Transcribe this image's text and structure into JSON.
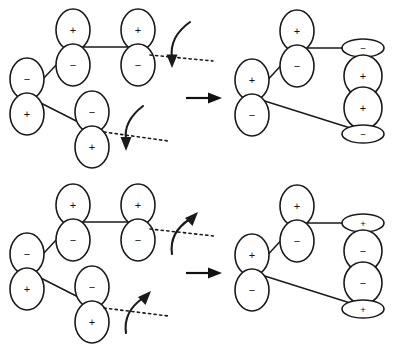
{
  "figure": {
    "stroke_color": "#1a1a1a",
    "background_color": "#ffffff"
  },
  "signs": {
    "plus": "+",
    "minus": "−"
  },
  "rows": [
    {
      "id": "row-top",
      "rotation_sense": "down",
      "reactant": {
        "name": "reactant-orbital-array-top",
        "orbitals": [
          {
            "id": "left-terminal",
            "top_lobe": "−",
            "bottom_lobe": "+"
          },
          {
            "id": "upper-inner",
            "top_lobe": "+",
            "bottom_lobe": "−"
          },
          {
            "id": "upper-terminal",
            "top_lobe": "+",
            "bottom_lobe": "−"
          },
          {
            "id": "lower-inner",
            "top_lobe": "−",
            "bottom_lobe": "+"
          }
        ]
      },
      "rotation_arrows": [
        {
          "id": "arrow-upper-terminal",
          "direction": "down"
        },
        {
          "id": "arrow-lower-terminal",
          "direction": "down"
        }
      ],
      "reaction_arrow": {
        "name": "reaction-arrow-top",
        "direction": "right"
      },
      "product": {
        "name": "product-orbital-array-top",
        "orbitals": [
          {
            "id": "prod-left-terminal",
            "top_lobe": "+",
            "bottom_lobe": "−"
          },
          {
            "id": "prod-upper-inner",
            "top_lobe": "+",
            "bottom_lobe": "−"
          },
          {
            "id": "prod-stack-upper",
            "top_lobe": "−",
            "bottom_lobe": "+",
            "top_flat": true
          },
          {
            "id": "prod-stack-lower",
            "top_lobe": "+",
            "bottom_lobe": "−",
            "bottom_flat": true
          }
        ]
      }
    },
    {
      "id": "row-bottom",
      "rotation_sense": "up",
      "reactant": {
        "name": "reactant-orbital-array-bottom",
        "orbitals": [
          {
            "id": "left-terminal",
            "top_lobe": "−",
            "bottom_lobe": "+"
          },
          {
            "id": "upper-inner",
            "top_lobe": "+",
            "bottom_lobe": "−"
          },
          {
            "id": "upper-terminal",
            "top_lobe": "+",
            "bottom_lobe": "−"
          },
          {
            "id": "lower-inner",
            "top_lobe": "−",
            "bottom_lobe": "+"
          }
        ]
      },
      "rotation_arrows": [
        {
          "id": "arrow-upper-terminal",
          "direction": "up"
        },
        {
          "id": "arrow-lower-terminal",
          "direction": "up"
        }
      ],
      "reaction_arrow": {
        "name": "reaction-arrow-bottom",
        "direction": "right"
      },
      "product": {
        "name": "product-orbital-array-bottom",
        "orbitals": [
          {
            "id": "prod-left-terminal",
            "top_lobe": "+",
            "bottom_lobe": "−"
          },
          {
            "id": "prod-upper-inner",
            "top_lobe": "+",
            "bottom_lobe": "−"
          },
          {
            "id": "prod-stack-upper",
            "top_lobe": "+",
            "bottom_lobe": "−",
            "top_flat": true
          },
          {
            "id": "prod-stack-lower",
            "top_lobe": "−",
            "bottom_lobe": "+",
            "bottom_flat": true
          }
        ]
      }
    }
  ]
}
